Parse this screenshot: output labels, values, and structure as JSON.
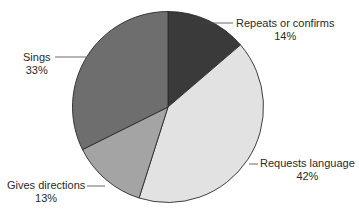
{
  "chart_data": {
    "type": "pie",
    "title": "",
    "start_angle_deg": 0,
    "direction": "clockwise",
    "slices": [
      {
        "label": "Repeats or confirms",
        "value": 14,
        "display": "14%",
        "color": "#3a3a3a"
      },
      {
        "label": "Requests language",
        "value": 42,
        "display": "42%",
        "color": "#e2e2e2"
      },
      {
        "label": "Gives directions",
        "value": 13,
        "display": "13%",
        "color": "#a4a4a4"
      },
      {
        "label": "Sings",
        "value": 33,
        "display": "33%",
        "color": "#6e6e6e"
      }
    ],
    "legend": "none (callout labels with leader lines)"
  },
  "labels": {
    "repeats": {
      "name": "Repeats or confirms",
      "pct": "14%"
    },
    "requests": {
      "name": "Requests language",
      "pct": "42%"
    },
    "directions": {
      "name": "Gives directions",
      "pct": "13%"
    },
    "sings": {
      "name": "Sings",
      "pct": "33%"
    }
  }
}
